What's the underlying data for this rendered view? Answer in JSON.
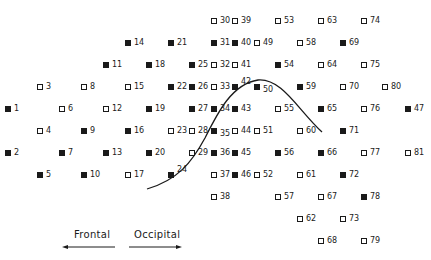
{
  "diagram": {
    "legend": {
      "filled": "filled-square",
      "open": "open-square"
    },
    "markers": [
      {
        "id": "1",
        "filled": true,
        "x": 5,
        "y": 131
      },
      {
        "id": "2",
        "filled": true,
        "x": 5,
        "y": 175
      },
      {
        "id": "3",
        "filled": false,
        "x": 37,
        "y": 109
      },
      {
        "id": "4",
        "filled": false,
        "x": 37,
        "y": 153
      },
      {
        "id": "5",
        "filled": true,
        "x": 37,
        "y": 197
      },
      {
        "id": "6",
        "filled": false,
        "x": 59,
        "y": 131
      },
      {
        "id": "7",
        "filled": true,
        "x": 59,
        "y": 175
      },
      {
        "id": "8",
        "filled": false,
        "x": 81,
        "y": 109
      },
      {
        "id": "9",
        "filled": true,
        "x": 81,
        "y": 153
      },
      {
        "id": "10",
        "filled": true,
        "x": 81,
        "y": 197
      },
      {
        "id": "11",
        "filled": true,
        "x": 103,
        "y": 87
      },
      {
        "id": "12",
        "filled": false,
        "x": 103,
        "y": 131
      },
      {
        "id": "13",
        "filled": true,
        "x": 103,
        "y": 175
      },
      {
        "id": "14",
        "filled": true,
        "x": 125,
        "y": 65
      },
      {
        "id": "15",
        "filled": false,
        "x": 125,
        "y": 109
      },
      {
        "id": "16",
        "filled": true,
        "x": 125,
        "y": 153
      },
      {
        "id": "17",
        "filled": false,
        "x": 125,
        "y": 197
      },
      {
        "id": "18",
        "filled": true,
        "x": 146,
        "y": 87
      },
      {
        "id": "19",
        "filled": true,
        "x": 146,
        "y": 131
      },
      {
        "id": "20",
        "filled": true,
        "x": 146,
        "y": 175
      },
      {
        "id": "21",
        "filled": true,
        "x": 168,
        "y": 65
      },
      {
        "id": "22",
        "filled": true,
        "x": 168,
        "y": 109
      },
      {
        "id": "23",
        "filled": false,
        "x": 168,
        "y": 153
      },
      {
        "id": "24",
        "filled": true,
        "x": 168,
        "y": 197,
        "label_pos": "sup"
      },
      {
        "id": "25",
        "filled": true,
        "x": 189,
        "y": 87
      },
      {
        "id": "26",
        "filled": true,
        "x": 189,
        "y": 109
      },
      {
        "id": "27",
        "filled": true,
        "x": 189,
        "y": 131
      },
      {
        "id": "28",
        "filled": false,
        "x": 189,
        "y": 153
      },
      {
        "id": "29",
        "filled": false,
        "x": 189,
        "y": 175
      },
      {
        "id": "30",
        "filled": false,
        "x": 211,
        "y": 43
      },
      {
        "id": "31",
        "filled": true,
        "x": 211,
        "y": 65
      },
      {
        "id": "32",
        "filled": false,
        "x": 211,
        "y": 87
      },
      {
        "id": "33",
        "filled": false,
        "x": 211,
        "y": 109
      },
      {
        "id": "34",
        "filled": true,
        "x": 211,
        "y": 131
      },
      {
        "id": "35",
        "filled": true,
        "x": 211,
        "y": 153,
        "label_pos": "sub"
      },
      {
        "id": "36",
        "filled": true,
        "x": 211,
        "y": 175
      },
      {
        "id": "37",
        "filled": false,
        "x": 211,
        "y": 197
      },
      {
        "id": "38",
        "filled": false,
        "x": 211,
        "y": 219
      },
      {
        "id": "39",
        "filled": false,
        "x": 232,
        "y": 43
      },
      {
        "id": "40",
        "filled": true,
        "x": 232,
        "y": 65
      },
      {
        "id": "41",
        "filled": false,
        "x": 232,
        "y": 87
      },
      {
        "id": "42",
        "filled": true,
        "x": 232,
        "y": 109,
        "label_pos": "sup"
      },
      {
        "id": "43",
        "filled": true,
        "x": 232,
        "y": 131
      },
      {
        "id": "44",
        "filled": false,
        "x": 232,
        "y": 153
      },
      {
        "id": "45",
        "filled": true,
        "x": 232,
        "y": 175
      },
      {
        "id": "46",
        "filled": true,
        "x": 232,
        "y": 197
      },
      {
        "id": "49",
        "filled": false,
        "x": 254,
        "y": 65
      },
      {
        "id": "50",
        "filled": true,
        "x": 254,
        "y": 109,
        "label_pos": "sub"
      },
      {
        "id": "51",
        "filled": false,
        "x": 254,
        "y": 153
      },
      {
        "id": "52",
        "filled": false,
        "x": 254,
        "y": 197
      },
      {
        "id": "53",
        "filled": false,
        "x": 275,
        "y": 43
      },
      {
        "id": "54",
        "filled": true,
        "x": 275,
        "y": 87
      },
      {
        "id": "55",
        "filled": false,
        "x": 275,
        "y": 131
      },
      {
        "id": "56",
        "filled": true,
        "x": 275,
        "y": 175
      },
      {
        "id": "57",
        "filled": false,
        "x": 275,
        "y": 219
      },
      {
        "id": "58",
        "filled": false,
        "x": 297,
        "y": 65
      },
      {
        "id": "59",
        "filled": true,
        "x": 297,
        "y": 109
      },
      {
        "id": "60",
        "filled": false,
        "x": 297,
        "y": 153
      },
      {
        "id": "61",
        "filled": false,
        "x": 297,
        "y": 197
      },
      {
        "id": "62",
        "filled": false,
        "x": 297,
        "y": 241
      },
      {
        "id": "63",
        "filled": false,
        "x": 318,
        "y": 43
      },
      {
        "id": "64",
        "filled": false,
        "x": 318,
        "y": 87
      },
      {
        "id": "65",
        "filled": true,
        "x": 318,
        "y": 131
      },
      {
        "id": "66",
        "filled": true,
        "x": 318,
        "y": 175
      },
      {
        "id": "67",
        "filled": false,
        "x": 318,
        "y": 219
      },
      {
        "id": "68",
        "filled": false,
        "x": 318,
        "y": 263
      },
      {
        "id": "69",
        "filled": true,
        "x": 340,
        "y": 65
      },
      {
        "id": "70",
        "filled": false,
        "x": 340,
        "y": 109
      },
      {
        "id": "71",
        "filled": true,
        "x": 340,
        "y": 153
      },
      {
        "id": "72",
        "filled": true,
        "x": 340,
        "y": 197
      },
      {
        "id": "73",
        "filled": false,
        "x": 340,
        "y": 241
      },
      {
        "id": "74",
        "filled": false,
        "x": 361,
        "y": 43
      },
      {
        "id": "75",
        "filled": false,
        "x": 361,
        "y": 87
      },
      {
        "id": "76",
        "filled": false,
        "x": 361,
        "y": 131
      },
      {
        "id": "77",
        "filled": false,
        "x": 361,
        "y": 175
      },
      {
        "id": "78",
        "filled": true,
        "x": 361,
        "y": 219
      },
      {
        "id": "79",
        "filled": false,
        "x": 361,
        "y": 263
      },
      {
        "id": "80",
        "filled": false,
        "x": 382,
        "y": 109
      },
      {
        "id": "81",
        "filled": false,
        "x": 405,
        "y": 175
      },
      {
        "id": "47",
        "filled": true,
        "x": 405,
        "y": 131
      }
    ],
    "curve": {
      "description": "bell-shaped boundary curve",
      "stroke": "#1a1a1a"
    },
    "direction_labels": {
      "left": "Frontal",
      "right": "Occipital"
    }
  }
}
